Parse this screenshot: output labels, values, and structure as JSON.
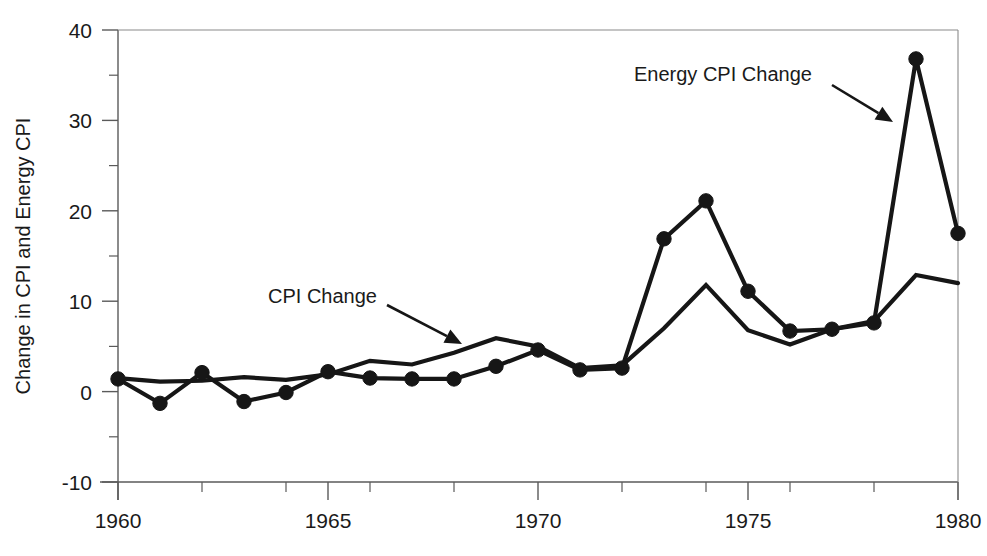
{
  "chart_data": {
    "type": "line",
    "title": "",
    "subtitle": "",
    "xlabel": "",
    "ylabel": "Change in CPI and Energy CPI",
    "xlim": [
      1960,
      1980
    ],
    "ylim": [
      -10,
      40
    ],
    "grid": false,
    "legend_position": "none",
    "x_major_ticks": [
      1960,
      1965,
      1970,
      1975,
      1980
    ],
    "x_major_tick_labels": [
      "1960",
      "1965",
      "1970",
      "1975",
      "1980"
    ],
    "x_minor_ticks": [
      1962,
      1964,
      1966,
      1968,
      1972,
      1974,
      1976,
      1978
    ],
    "y_major_ticks": [
      -10,
      0,
      10,
      20,
      30,
      40
    ],
    "y_major_tick_labels": [
      "-10",
      "0",
      "10",
      "20",
      "30",
      "40"
    ],
    "y_minor_ticks": [
      -5,
      5,
      15,
      25,
      35
    ],
    "x": [
      1960,
      1961,
      1962,
      1963,
      1964,
      1965,
      1966,
      1967,
      1968,
      1969,
      1970,
      1971,
      1972,
      1973,
      1974,
      1975,
      1976,
      1977,
      1978,
      1979,
      1980
    ],
    "series": [
      {
        "name": "Energy CPI Change",
        "markers": true,
        "values": [
          1.4,
          -1.3,
          2.1,
          -1.1,
          -0.1,
          2.2,
          1.5,
          1.4,
          1.4,
          2.8,
          4.6,
          2.4,
          2.6,
          16.9,
          21.1,
          11.1,
          6.7,
          6.9,
          7.6,
          36.8,
          17.5
        ]
      },
      {
        "name": "CPI Change",
        "markers": false,
        "values": [
          1.5,
          1.1,
          1.2,
          1.6,
          1.3,
          1.9,
          3.4,
          3.0,
          4.3,
          5.9,
          5.0,
          2.6,
          2.9,
          7.0,
          11.8,
          6.8,
          5.2,
          6.9,
          7.8,
          12.9,
          12.0
        ]
      }
    ],
    "annotations": [
      {
        "id": "cpi-change-annotation",
        "label": "CPI Change",
        "label_x": 268,
        "label_y": 303,
        "arrow_from_x": 387,
        "arrow_from_y": 305,
        "arrow_to_x": 462,
        "arrow_to_y": 344
      },
      {
        "id": "energy-cpi-change-annotation",
        "label": "Energy CPI Change",
        "label_x": 634,
        "label_y": 81,
        "arrow_from_x": 832,
        "arrow_from_y": 85,
        "arrow_to_x": 893,
        "arrow_to_y": 122
      }
    ],
    "colors": {
      "line": "#161616",
      "marker": "#161616",
      "axis": "#5a5a5a",
      "frame": "#8a8a8a",
      "background": "#ffffff",
      "text": "#1a1a1a"
    }
  }
}
